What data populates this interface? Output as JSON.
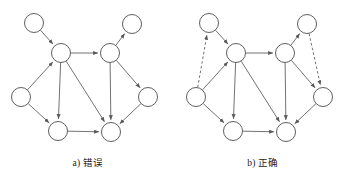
{
  "figure": {
    "width": 351,
    "height": 182,
    "background": "#ffffff",
    "node_fill": "#ffffff",
    "node_stroke": "#4d4d4d",
    "edge_color": "#595959",
    "node_radius": 9.5
  },
  "panels": [
    {
      "id": "panel-a",
      "caption": "a) 错误",
      "nodes": [
        {
          "id": "n1",
          "label": "",
          "x": 34,
          "y": 23
        },
        {
          "id": "n2",
          "label": "",
          "x": 132,
          "y": 24
        },
        {
          "id": "n3",
          "label": "",
          "x": 61,
          "y": 53
        },
        {
          "id": "n4",
          "label": "",
          "x": 110,
          "y": 53
        },
        {
          "id": "n5",
          "label": "",
          "x": 21,
          "y": 97
        },
        {
          "id": "n6",
          "label": "",
          "x": 148,
          "y": 97
        },
        {
          "id": "n7",
          "label": "",
          "x": 58,
          "y": 131
        },
        {
          "id": "n8",
          "label": "",
          "x": 111,
          "y": 132
        }
      ],
      "edges": [
        {
          "from": "n1",
          "to": "n3",
          "style": "solid",
          "arrow": true
        },
        {
          "from": "n4",
          "to": "n2",
          "style": "solid",
          "arrow": true
        },
        {
          "from": "n3",
          "to": "n4",
          "style": "solid",
          "arrow": true
        },
        {
          "from": "n5",
          "to": "n3",
          "style": "solid",
          "arrow": true
        },
        {
          "from": "n5",
          "to": "n7",
          "style": "solid",
          "arrow": true
        },
        {
          "from": "n3",
          "to": "n7",
          "style": "solid",
          "arrow": true
        },
        {
          "from": "n3",
          "to": "n8",
          "style": "solid",
          "arrow": true
        },
        {
          "from": "n4",
          "to": "n8",
          "style": "solid",
          "arrow": true
        },
        {
          "from": "n4",
          "to": "n6",
          "style": "solid",
          "arrow": true
        },
        {
          "from": "n6",
          "to": "n8",
          "style": "solid",
          "arrow": true
        },
        {
          "from": "n7",
          "to": "n8",
          "style": "solid",
          "arrow": true
        }
      ]
    },
    {
      "id": "panel-b",
      "caption": "b) 正确",
      "nodes": [
        {
          "id": "n1",
          "label": "",
          "x": 34,
          "y": 23
        },
        {
          "id": "n2",
          "label": "",
          "x": 132,
          "y": 24
        },
        {
          "id": "n3",
          "label": "",
          "x": 61,
          "y": 53
        },
        {
          "id": "n4",
          "label": "",
          "x": 110,
          "y": 53
        },
        {
          "id": "n5",
          "label": "",
          "x": 21,
          "y": 97
        },
        {
          "id": "n6",
          "label": "",
          "x": 148,
          "y": 97
        },
        {
          "id": "n7",
          "label": "",
          "x": 58,
          "y": 131
        },
        {
          "id": "n8",
          "label": "",
          "x": 111,
          "y": 132
        }
      ],
      "edges": [
        {
          "from": "n1",
          "to": "n3",
          "style": "solid",
          "arrow": true
        },
        {
          "from": "n4",
          "to": "n2",
          "style": "solid",
          "arrow": true
        },
        {
          "from": "n3",
          "to": "n4",
          "style": "solid",
          "arrow": true
        },
        {
          "from": "n5",
          "to": "n3",
          "style": "solid",
          "arrow": true
        },
        {
          "from": "n5",
          "to": "n7",
          "style": "solid",
          "arrow": true
        },
        {
          "from": "n3",
          "to": "n7",
          "style": "solid",
          "arrow": true
        },
        {
          "from": "n3",
          "to": "n8",
          "style": "solid",
          "arrow": true
        },
        {
          "from": "n4",
          "to": "n8",
          "style": "solid",
          "arrow": true
        },
        {
          "from": "n4",
          "to": "n6",
          "style": "solid",
          "arrow": true
        },
        {
          "from": "n6",
          "to": "n8",
          "style": "solid",
          "arrow": true
        },
        {
          "from": "n7",
          "to": "n8",
          "style": "solid",
          "arrow": true
        },
        {
          "from": "n5",
          "to": "n1",
          "style": "dashed",
          "arrow": true
        },
        {
          "from": "n2",
          "to": "n6",
          "style": "dashed",
          "arrow": true
        }
      ]
    }
  ]
}
